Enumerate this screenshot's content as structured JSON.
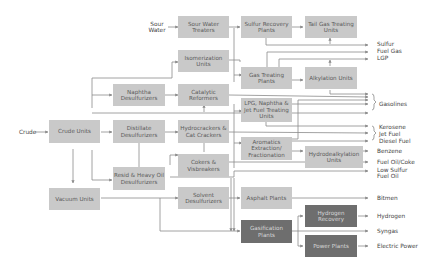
{
  "inputs": {
    "sour_water": "Sour\nWater",
    "crude": "Crude"
  },
  "units": {
    "sour_water_treaters": "Sour Water Treaters",
    "sulfur_recovery_plants": "Sulfur Recovery Plants",
    "tail_gas_treating_units": "Tail Gas Treating Units",
    "isomerization_units": "Isomerization Units",
    "gas_treating_plants": "Gas Treating Plants",
    "alkylation_units": "Alkylation Units",
    "naphtha_desulfurizers": "Naphtha Desulfurizers",
    "catalytic_reformers": "Catalytic Reformers",
    "lpg_naphtha_jet_fuel_treating_units": "LPG, Naphtha & Jet Fuel Treating Units",
    "crude_units": "Crude Units",
    "distillate_desulfurizers": "Distillate Desulfurizers",
    "hydrocrackers_cat_crackers": "Hydrocrackers & Cat Crackers",
    "aromatics_extraction_fractionation": "Aromatics Extraction/ Fractionation",
    "hydrodealkylation_units": "Hydrodealkylation Units",
    "cokers_visbreakers": "Cokers & Visbreakers",
    "resid_heavy_oil_desulfurizers": "Resid & Heavy Oil Desulfurizers",
    "vacuum_units": "Vacuum Units",
    "solvent_desulfurizers": "Solvent Desulfurizers",
    "asphalt_plants": "Asphalt Plants",
    "gasification_plants": "Gasification Plants",
    "hydrogen_recovery": "Hydrogen Recovery",
    "power_plants": "Power Plants"
  },
  "products": {
    "sulfur": "Sulfur",
    "fuel_gas": "Fuel Gas",
    "lgp": "LGP",
    "gasolines": "Gasolines",
    "kerosene": "Kerosene",
    "jet_fuel": "Jet Fuel",
    "diesel_fuel": "Diesel Fuel",
    "benzene": "Benzene",
    "fuel_oil_coke": "Fuel Oil/Coke",
    "low_sulfur_fuel_oil": "Low Sulfur\nFuel Oil",
    "bitmen": "Bitmen",
    "hydrogen": "Hydrogen",
    "syngas": "Syngas",
    "electric_power": "Electric Power"
  },
  "colors": {
    "box_light": "#c9c9c9",
    "box_dark": "#6e6e6e",
    "line": "#8a8a8a"
  }
}
